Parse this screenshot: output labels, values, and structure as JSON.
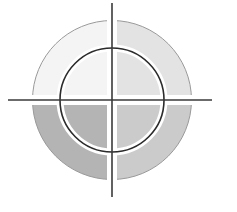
{
  "canvas": {
    "width": 237,
    "height": 212,
    "background": "#ffffff",
    "title": "Crosshair Target Emblem"
  },
  "emblem": {
    "name": "crosshair-target-emblem",
    "center": {
      "x": 112,
      "y": 100
    },
    "disc": {
      "outer_radius": 80,
      "gap_half_width": 5,
      "edge_stroke": "#9a9a9a",
      "edge_stroke_width": 1
    },
    "quadrants": [
      {
        "id": "top-left",
        "label": "Top Left Quadrant",
        "fill": "#f4f4f4",
        "start_angle": 180,
        "end_angle": 270
      },
      {
        "id": "top-right",
        "label": "Top Right Quadrant",
        "fill": "#e3e3e3",
        "start_angle": 270,
        "end_angle": 360
      },
      {
        "id": "bottom-left",
        "label": "Bottom Left Quadrant",
        "fill": "#b4b4b4",
        "start_angle": 90,
        "end_angle": 180
      },
      {
        "id": "bottom-right",
        "label": "Bottom Right Quadrant",
        "fill": "#cbcbcb",
        "start_angle": 0,
        "end_angle": 90
      }
    ],
    "inner_ring": {
      "label": "Inner Ring",
      "radius": 52,
      "stroke": "#2b2b2b",
      "stroke_width": 1.6,
      "halo_stroke": "#ffffff",
      "halo_width": 7
    },
    "crosshair": {
      "label": "Crosshair Lines",
      "stroke": "#3a3a3a",
      "stroke_width": 1.6,
      "vertical": {
        "x": 112,
        "y1": 3,
        "y2": 197
      },
      "horizontal": {
        "y": 100,
        "x1": 8,
        "x2": 212
      }
    }
  }
}
